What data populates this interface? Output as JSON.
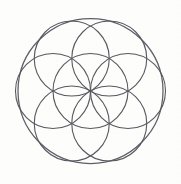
{
  "figure": {
    "title": "Seed of Life",
    "canvas": {
      "width": 181,
      "height": 184
    },
    "background_color": "#fdfdfc",
    "stroke_color": "#4a4a52",
    "stroke_width": 1.15
  },
  "geometry": {
    "center": {
      "x": 90.5,
      "y": 91.0
    },
    "seed_radius": 37.5,
    "outer_radius": 72.5,
    "seed_circle_count": 7,
    "petal_circle_count": 6,
    "ring_angles_deg": [
      0,
      60,
      120,
      180,
      240,
      300
    ],
    "circles": [
      {
        "name": "outer-enclosing-circle",
        "cx": 90.5,
        "cy": 91.0,
        "r": 72.5,
        "role": "outer"
      },
      {
        "name": "seed-circle-center",
        "cx": 90.5,
        "cy": 91.0,
        "r": 37.5,
        "role": "seed"
      },
      {
        "name": "seed-circle-east",
        "cx": 128.0,
        "cy": 91.0,
        "r": 37.5,
        "role": "seed"
      },
      {
        "name": "seed-circle-northeast",
        "cx": 109.25,
        "cy": 58.53,
        "r": 37.5,
        "role": "seed"
      },
      {
        "name": "seed-circle-northwest",
        "cx": 71.75,
        "cy": 58.53,
        "r": 37.5,
        "role": "seed"
      },
      {
        "name": "seed-circle-west",
        "cx": 53.0,
        "cy": 91.0,
        "r": 37.5,
        "role": "seed"
      },
      {
        "name": "seed-circle-southwest",
        "cx": 71.75,
        "cy": 123.47,
        "r": 37.5,
        "role": "seed"
      },
      {
        "name": "seed-circle-southeast",
        "cx": 109.25,
        "cy": 123.47,
        "r": 37.5,
        "role": "seed"
      }
    ]
  }
}
